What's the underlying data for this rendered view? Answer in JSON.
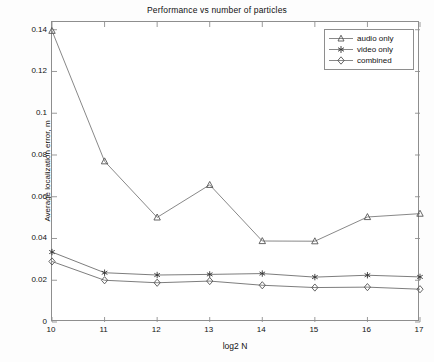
{
  "chart_data": {
    "type": "line",
    "title": "Performance vs number of particles",
    "xlabel": "log2 N",
    "ylabel": "Average localization error, m",
    "x": [
      10,
      11,
      12,
      13,
      14,
      15,
      16,
      17
    ],
    "xtick_labels": [
      "10",
      "11",
      "12",
      "13",
      "14",
      "15",
      "16",
      "17"
    ],
    "ytick_labels": [
      "0",
      "0.02",
      "0.04",
      "0.06",
      "0.08",
      "0.1",
      "0.12",
      "0.14"
    ],
    "ytick_values": [
      0,
      0.02,
      0.04,
      0.06,
      0.08,
      0.1,
      0.12,
      0.14
    ],
    "xlim": [
      10,
      17
    ],
    "ylim": [
      0,
      0.1437
    ],
    "grid": false,
    "legend_position": "top-right",
    "series": [
      {
        "name": "audio only",
        "marker": "triangle",
        "color": "#7a7a7a",
        "values": [
          0.1395,
          0.077,
          0.0501,
          0.0657,
          0.0388,
          0.0387,
          0.0503,
          0.0519
        ]
      },
      {
        "name": "video only",
        "marker": "asterisk",
        "color": "#6e6e6e",
        "values": [
          0.0335,
          0.0236,
          0.0225,
          0.0228,
          0.0232,
          0.0215,
          0.0224,
          0.0216
        ]
      },
      {
        "name": "combined",
        "marker": "diamond",
        "color": "#6e6e6e",
        "values": [
          0.029,
          0.02,
          0.0188,
          0.0196,
          0.0176,
          0.0165,
          0.0167,
          0.0157
        ]
      }
    ]
  },
  "legend": {
    "entries": [
      {
        "label": "audio only",
        "marker": "triangle"
      },
      {
        "label": "video only",
        "marker": "asterisk"
      },
      {
        "label": "combined",
        "marker": "diamond"
      }
    ]
  },
  "style": {
    "line_color": "#7a7a7a",
    "axis_color": "#8e8e8e",
    "text_color": "#111111",
    "background": "#ffffff"
  }
}
